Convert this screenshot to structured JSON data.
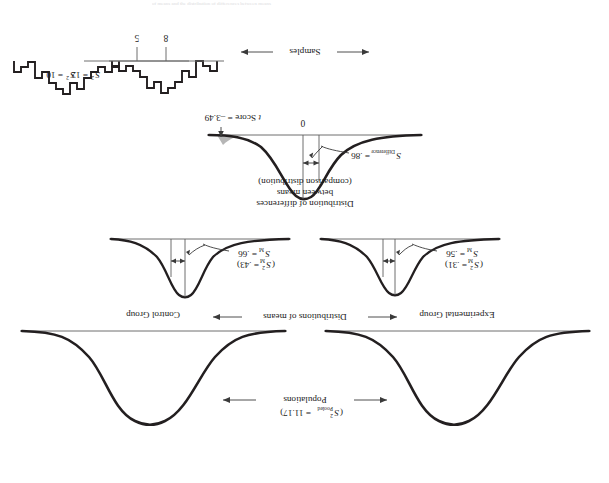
{
  "figure": {
    "title_faint": "of means and the distribution of differences between means",
    "orientation_note": "rotated-180",
    "row_labels": {
      "populations": "Populations",
      "populations_stat_base": "S",
      "populations_stat_sup": "2",
      "populations_stat_sub": "Pooled",
      "populations_stat_value": "= 11.17)",
      "populations_stat_full": "(S2Pooled = 11.17)",
      "distributions_of_means": "Distributions of means",
      "distribution_of_differences_line1": "Distribution of differences",
      "distribution_of_differences_line2": "between means",
      "distribution_of_differences_line3": "(comparison distribution)",
      "samples": "Samples"
    },
    "groups": {
      "left": "Control Group",
      "right": "Experimental Group"
    },
    "population_curves": [
      {
        "name": "control-population-curve",
        "group": "Control Group"
      },
      {
        "name": "experimental-population-curve",
        "group": "Experimental Group"
      }
    ],
    "distribution_of_means": {
      "left": {
        "sd_base": "S",
        "sd_sub": "M",
        "sd_value": "= .56",
        "sd_full": "SM = .56",
        "var_base": "S",
        "var_sup": "2",
        "var_sub": "M",
        "var_value": "= .31)",
        "var_full": "(S2M = .31)"
      },
      "right": {
        "sd_base": "S",
        "sd_sub": "M",
        "sd_value": "= .66",
        "sd_full": "SM = .66",
        "var_base": "S",
        "var_sup": "2",
        "var_sub": "M",
        "var_value": "= .43)",
        "var_full": "(S2M = .43)"
      }
    },
    "comparison_distribution": {
      "sd_base": "S",
      "sd_sub": "Difference",
      "sd_value": "= .86",
      "sd_full": "SDifference = .86",
      "center_tick_label": "0",
      "t_score_label_italic": "t",
      "t_score_label_rest": "Score = –3.49",
      "t_score_full": "t Score = –3.49",
      "t_score_value": -3.49,
      "shaded_region": "rejection-tail-left"
    },
    "samples": {
      "left": {
        "mean_label": "8",
        "variance_base": "S",
        "variance_sup": "2",
        "variance_value": "= 12",
        "variance_full": "S2 = 12",
        "bars": [
          1,
          2,
          3,
          2,
          4,
          5,
          6,
          7,
          6,
          8,
          9,
          8,
          7,
          6,
          5,
          4,
          3,
          2,
          1
        ],
        "histogram_name": "control-sample-histogram"
      },
      "right": {
        "mean_label": "5",
        "variance_base": "S",
        "variance_sup": "2",
        "variance_value": "= 10",
        "variance_full": "S2 = 10",
        "bars": [
          1,
          2,
          3,
          4,
          3,
          5,
          6,
          7,
          8,
          7,
          9,
          8,
          6,
          5,
          4,
          3,
          2,
          1
        ],
        "histogram_name": "experimental-sample-histogram"
      }
    },
    "colors": {
      "ink": "#231f20",
      "rule": "#6f6f6f",
      "shade": "#a9a9a9",
      "background": "#ffffff"
    }
  }
}
